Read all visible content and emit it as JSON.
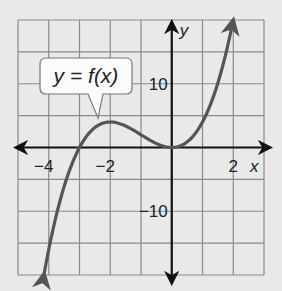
{
  "chart_data": {
    "type": "line",
    "title": "",
    "xlabel": "x",
    "ylabel": "y",
    "xlim": [
      -5,
      3
    ],
    "ylim": [
      -20,
      20
    ],
    "grid": true,
    "x_grid_step": 1,
    "y_grid_step": 5,
    "x_tick_labels": [
      "-4",
      "-2",
      "2"
    ],
    "y_tick_labels": [
      "10",
      "-10"
    ],
    "annotation": "y = f(x)",
    "series": [
      {
        "name": "y = f(x)",
        "x": [
          -4.15,
          -4,
          -3.5,
          -3,
          -2.5,
          -2,
          -1.5,
          -1,
          -0.5,
          0,
          0.5,
          1,
          1.5,
          2
        ],
        "values": [
          -19.8,
          -16,
          -6.1,
          0,
          3.1,
          4,
          3.4,
          2,
          0.6,
          0,
          0.9,
          4,
          10.1,
          20
        ]
      }
    ],
    "colors": {
      "curve": "#555555",
      "axes": "#111111",
      "grid": "#8a8a8a",
      "background": "#e9e9e9"
    }
  }
}
